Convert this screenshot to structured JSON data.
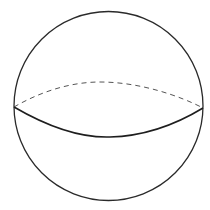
{
  "diagram": {
    "background_color": "#ffffff",
    "outline": {
      "shape": "circle",
      "cx": 108.5,
      "cy": 106,
      "r": 94.5,
      "color": "#2a2a2a"
    },
    "equator_front": {
      "style": "solid",
      "color": "#1e1e1e",
      "path": "M 14 107 C 50 128, 80 138, 110 137 C 150 136, 180 122, 203 108"
    },
    "equator_back": {
      "style": "dashed",
      "color": "#555555",
      "path": "M 14 107 C 40 92, 70 82, 100 82 C 140 82, 180 96, 203 108"
    }
  }
}
